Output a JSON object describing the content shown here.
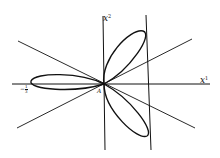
{
  "diagram": {
    "type": "rose-curve-plot",
    "axes": {
      "x_label": "x",
      "x_superscript": "1",
      "y_label": "x",
      "y_superscript": "2"
    },
    "origin_label": "A",
    "tick_label": "-1/3",
    "tick_label_num": "1",
    "tick_label_den": "3",
    "elements": [
      "three-petal closed curve",
      "two diagonal lines through origin",
      "vertical tangent line at right"
    ]
  }
}
